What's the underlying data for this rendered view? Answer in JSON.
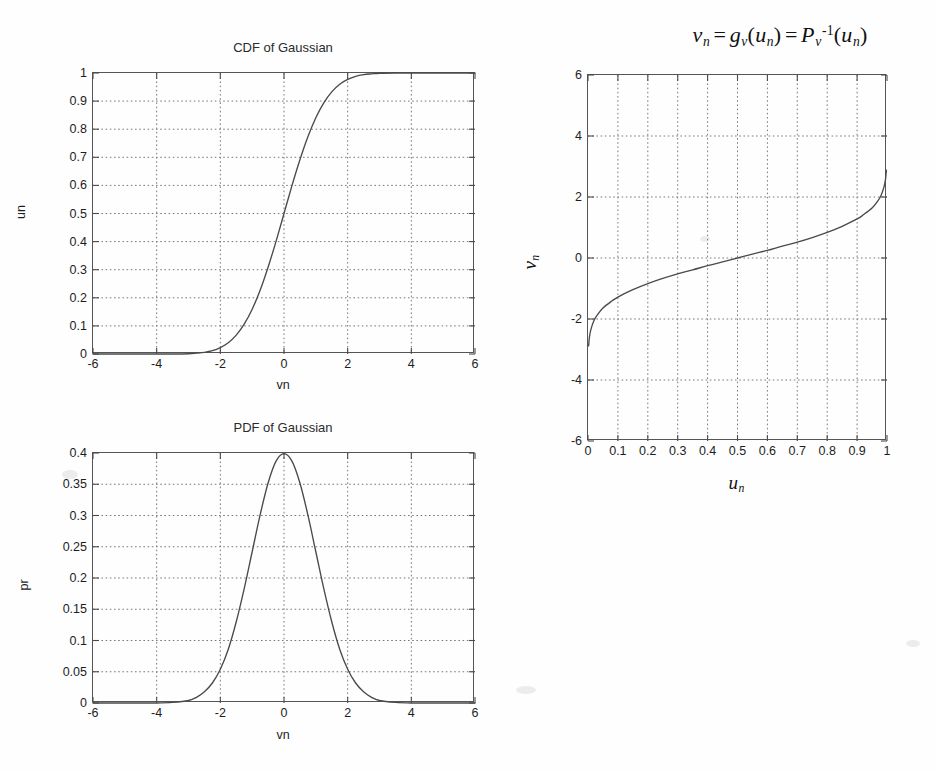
{
  "page": {
    "background_color": "#fefefe",
    "ink_color": "#4a4a4a"
  },
  "figures": {
    "cdf": {
      "title": "CDF of Gaussian",
      "xlabel": "vn",
      "ylabel": "un",
      "xticks": [
        "-6",
        "-4",
        "-2",
        "0",
        "2",
        "4",
        "6"
      ],
      "yticks": [
        "0",
        "0.1",
        "0.2",
        "0.3",
        "0.4",
        "0.5",
        "0.6",
        "0.7",
        "0.8",
        "0.9",
        "1"
      ]
    },
    "pdf": {
      "title": "PDF of Gaussian",
      "xlabel": "vn",
      "ylabel": "pr",
      "xticks": [
        "-6",
        "-4",
        "-2",
        "0",
        "2",
        "4",
        "6"
      ],
      "yticks": [
        "0",
        "0.05",
        "0.1",
        "0.15",
        "0.2",
        "0.25",
        "0.3",
        "0.35",
        "0.4"
      ]
    },
    "inverse_cdf": {
      "title_plain": "v_n = g_v(u_n) = P_v^-1(u_n)",
      "title_parts": {
        "v": "v",
        "n1": "n",
        "eq1": "=",
        "g": "g",
        "vsub": "v",
        "lparen1": "(",
        "u1": "u",
        "n2": "n",
        "rparen1": ")",
        "eq2": "=",
        "P": "P",
        "vsub2": "v",
        "inv": "-1",
        "lparen2": "(",
        "u2": "u",
        "n3": "n",
        "rparen2": ")"
      },
      "xlabel_plain": "u_n",
      "xlabel_parts": {
        "base": "u",
        "sub": "n"
      },
      "ylabel_plain": "v_n",
      "ylabel_parts": {
        "base": "v",
        "sub": "n"
      },
      "xticks": [
        "0",
        "0.1",
        "0.2",
        "0.3",
        "0.4",
        "0.5",
        "0.6",
        "0.7",
        "0.8",
        "0.9",
        "1"
      ],
      "yticks": [
        "-6",
        "-4",
        "-2",
        "0",
        "2",
        "4",
        "6"
      ]
    }
  },
  "chart_data": [
    {
      "id": "cdf",
      "type": "line",
      "title": "CDF of Gaussian",
      "xlabel": "vn",
      "ylabel": "un",
      "xlim": [
        -6,
        6
      ],
      "ylim": [
        0,
        1
      ],
      "xticks": [
        -6,
        -4,
        -2,
        0,
        2,
        4,
        6
      ],
      "yticks": [
        0,
        0.1,
        0.2,
        0.3,
        0.4,
        0.5,
        0.6,
        0.7,
        0.8,
        0.9,
        1
      ],
      "grid": true,
      "legend": null,
      "series": [
        {
          "name": "Gaussian CDF",
          "description": "Standard normal cumulative distribution function, mean 0, std 1",
          "x": [
            -6,
            -5.5,
            -5,
            -4.5,
            -4,
            -3.5,
            -3,
            -2.75,
            -2.5,
            -2.25,
            -2,
            -1.75,
            -1.5,
            -1.25,
            -1,
            -0.75,
            -0.5,
            -0.25,
            0,
            0.25,
            0.5,
            0.75,
            1,
            1.25,
            1.5,
            1.75,
            2,
            2.25,
            2.5,
            2.75,
            3,
            3.5,
            4,
            4.5,
            5,
            5.5,
            6
          ],
          "y": [
            0.0,
            0.0,
            0.0,
            0.0,
            0.0,
            0.0,
            0.001,
            0.003,
            0.006,
            0.012,
            0.023,
            0.04,
            0.067,
            0.106,
            0.159,
            0.227,
            0.309,
            0.401,
            0.5,
            0.599,
            0.691,
            0.773,
            0.841,
            0.894,
            0.933,
            0.96,
            0.977,
            0.988,
            0.994,
            0.997,
            0.999,
            1.0,
            1.0,
            1.0,
            1.0,
            1.0,
            1.0
          ]
        }
      ]
    },
    {
      "id": "pdf",
      "type": "line",
      "title": "PDF of Gaussian",
      "xlabel": "vn",
      "ylabel": "pr",
      "xlim": [
        -6,
        6
      ],
      "ylim": [
        0,
        0.4
      ],
      "xticks": [
        -6,
        -4,
        -2,
        0,
        2,
        4,
        6
      ],
      "yticks": [
        0,
        0.05,
        0.1,
        0.15,
        0.2,
        0.25,
        0.3,
        0.35,
        0.4
      ],
      "grid": true,
      "legend": null,
      "series": [
        {
          "name": "Gaussian PDF",
          "description": "Standard normal probability density function, peak 0.3989 at v=0",
          "x": [
            -6,
            -5.5,
            -5,
            -4.5,
            -4,
            -3.5,
            -3,
            -2.75,
            -2.5,
            -2.25,
            -2,
            -1.75,
            -1.5,
            -1.25,
            -1,
            -0.75,
            -0.5,
            -0.25,
            0,
            0.25,
            0.5,
            0.75,
            1,
            1.25,
            1.5,
            1.75,
            2,
            2.25,
            2.5,
            2.75,
            3,
            3.5,
            4,
            4.5,
            5,
            5.5,
            6
          ],
          "y": [
            0.0,
            0.0,
            0.0,
            0.0,
            0.0,
            0.001,
            0.004,
            0.009,
            0.018,
            0.032,
            0.054,
            0.086,
            0.13,
            0.183,
            0.242,
            0.301,
            0.352,
            0.387,
            0.399,
            0.387,
            0.352,
            0.301,
            0.242,
            0.183,
            0.13,
            0.086,
            0.054,
            0.032,
            0.018,
            0.009,
            0.004,
            0.001,
            0.0,
            0.0,
            0.0,
            0.0,
            0.0
          ]
        }
      ]
    },
    {
      "id": "inverse_cdf",
      "type": "line",
      "title": "v_n = g_v(u_n) = P_v^-1(u_n)",
      "xlabel": "u_n",
      "ylabel": "v_n",
      "xlim": [
        0,
        1
      ],
      "ylim": [
        -6,
        6
      ],
      "xticks": [
        0,
        0.1,
        0.2,
        0.3,
        0.4,
        0.5,
        0.6,
        0.7,
        0.8,
        0.9,
        1
      ],
      "yticks": [
        -6,
        -4,
        -2,
        0,
        2,
        4,
        6
      ],
      "grid": true,
      "legend": null,
      "series": [
        {
          "name": "Inverse Gaussian CDF",
          "description": "Probit / inverse standard normal CDF, clipped near about -2.8 and 2.8 at the edges",
          "x": [
            0.002,
            0.005,
            0.01,
            0.02,
            0.03,
            0.05,
            0.08,
            0.1,
            0.15,
            0.2,
            0.25,
            0.3,
            0.35,
            0.4,
            0.45,
            0.5,
            0.55,
            0.6,
            0.65,
            0.7,
            0.75,
            0.8,
            0.85,
            0.9,
            0.92,
            0.95,
            0.97,
            0.98,
            0.99,
            0.995,
            0.998
          ],
          "y": [
            -2.88,
            -2.58,
            -2.33,
            -2.05,
            -1.88,
            -1.64,
            -1.41,
            -1.28,
            -1.04,
            -0.84,
            -0.67,
            -0.52,
            -0.39,
            -0.25,
            -0.13,
            0.0,
            0.13,
            0.25,
            0.39,
            0.52,
            0.67,
            0.84,
            1.04,
            1.28,
            1.41,
            1.64,
            1.88,
            2.05,
            2.33,
            2.58,
            2.88
          ]
        }
      ]
    }
  ]
}
